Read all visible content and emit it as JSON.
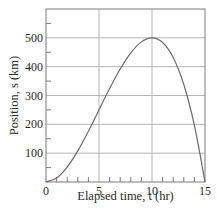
{
  "chart_data": {
    "type": "line",
    "title": "",
    "xlabel": "Elapsed time, t (hr)",
    "ylabel": "Position, s (km)",
    "xlim": [
      0,
      15
    ],
    "ylim": [
      0,
      600
    ],
    "x_ticks": [
      0,
      5,
      10,
      15
    ],
    "x_tick_labels": [
      "0",
      "5",
      "10",
      "15"
    ],
    "x_minor_step": 1,
    "y_ticks": [
      100,
      200,
      300,
      400,
      500
    ],
    "y_tick_labels": [
      "100",
      "200",
      "300",
      "400",
      "500"
    ],
    "y_minor_step": 50,
    "grid": true,
    "legend": null,
    "series": [
      {
        "name": "position",
        "x": [
          0,
          1,
          2,
          3,
          4,
          5,
          6,
          7,
          8,
          9,
          10,
          11,
          12,
          13,
          14,
          15
        ],
        "y": [
          0,
          14,
          52,
          108,
          176,
          250,
          324,
          392,
          448,
          486,
          500,
          484,
          432,
          338,
          196,
          0
        ]
      }
    ],
    "colors": {
      "line": "#6b6b6b",
      "grid": "#b5b5b5",
      "frame": "#7a7a7a"
    }
  },
  "axes": {
    "x_title": "Elapsed time, t (hr)",
    "y_title": "Position, s (km)"
  }
}
